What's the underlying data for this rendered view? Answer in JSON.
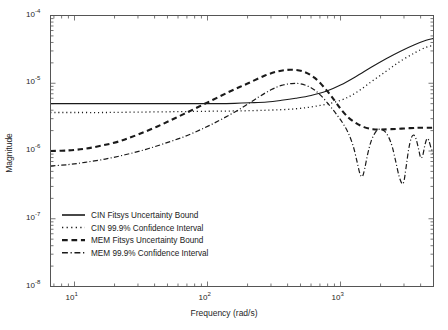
{
  "chart_data": {
    "type": "line",
    "title": "",
    "xlabel": "Frequency (rad/s)",
    "ylabel": "Magnitude",
    "xscale": "log",
    "yscale": "log",
    "xlim": [
      6.6,
      5000
    ],
    "ylim": [
      1e-08,
      0.0001
    ],
    "grid": false,
    "legend_position": "lower left",
    "xticks": [
      {
        "value": 10,
        "label": "10",
        "exp": "1"
      },
      {
        "value": 100,
        "label": "10",
        "exp": "2"
      },
      {
        "value": 1000,
        "label": "10",
        "exp": "3"
      }
    ],
    "yticks": [
      {
        "value": 0.0001,
        "label": "10",
        "exp": "-4"
      },
      {
        "value": 1e-05,
        "label": "10",
        "exp": "-5"
      },
      {
        "value": 1e-06,
        "label": "10",
        "exp": "-6"
      },
      {
        "value": 1e-07,
        "label": "10",
        "exp": "-7"
      },
      {
        "value": 1e-08,
        "label": "10",
        "exp": "-8"
      }
    ],
    "series": [
      {
        "name": "CIN Fitsys Uncertainty Bound",
        "style": "solid",
        "color": "#1a1a1a",
        "width": 1.1,
        "x": [
          6.6,
          8,
          10,
          13,
          17,
          22,
          30,
          40,
          55,
          70,
          90,
          120,
          160,
          210,
          280,
          360,
          460,
          600,
          780,
          1000,
          1300,
          1700,
          2200,
          2800,
          3600,
          4400,
          5000
        ],
        "y": [
          5e-06,
          5e-06,
          5e-06,
          5e-06,
          5e-06,
          5e-06,
          5e-06,
          5e-06,
          5e-06,
          5e-06,
          5e-06,
          5e-06,
          5.05e-06,
          5.15e-06,
          5.3e-06,
          5.6e-06,
          6e-06,
          6.6e-06,
          7.6e-06,
          9.4e-06,
          1.25e-05,
          1.72e-05,
          2.3e-05,
          2.95e-05,
          3.7e-05,
          4.3e-05,
          4.6e-05
        ]
      },
      {
        "name": "CIN 99.9% Confidence Interval",
        "style": "dotted",
        "color": "#1a1a1a",
        "width": 1.3,
        "x": [
          6.6,
          10,
          17,
          30,
          55,
          90,
          160,
          280,
          460,
          700,
          1000,
          1300,
          1700,
          2200,
          2800,
          3600,
          4400,
          5000
        ],
        "y": [
          3.7e-06,
          3.7e-06,
          3.7e-06,
          3.75e-06,
          3.8e-06,
          3.85e-06,
          3.9e-06,
          4e-06,
          4.2e-06,
          4.7e-06,
          5.6e-06,
          7.2e-06,
          1.05e-05,
          1.5e-05,
          2.1e-05,
          2.8e-05,
          3.4e-05,
          3.6e-05
        ]
      },
      {
        "name": "MEM Fitsys Uncertainty Bound",
        "style": "dashed",
        "color": "#1a1a1a",
        "width": 2.1,
        "x": [
          6.6,
          9,
          12,
          16,
          22,
          30,
          42,
          58,
          80,
          110,
          150,
          200,
          270,
          340,
          420,
          520,
          640,
          780,
          900,
          1020,
          1150,
          1300,
          1500,
          1750,
          2000,
          2400,
          3000,
          3800,
          4600,
          5000
        ],
        "y": [
          1e-06,
          1.02e-06,
          1.08e-06,
          1.2e-06,
          1.4e-06,
          1.75e-06,
          2.3e-06,
          3.1e-06,
          4.2e-06,
          5.7e-06,
          7.7e-06,
          9.9e-06,
          1.3e-05,
          1.5e-05,
          1.58e-05,
          1.5e-05,
          1.2e-05,
          8e-06,
          5.6e-06,
          4e-06,
          3.1e-06,
          2.6e-06,
          2.25e-06,
          2.1e-06,
          2.08e-06,
          2.1e-06,
          2.15e-06,
          2.2e-06,
          2.2e-06,
          2.2e-06
        ]
      },
      {
        "name": "MEM 99.9% Confidence Interval",
        "style": "dashdot",
        "color": "#1a1a1a",
        "width": 1.2,
        "x": [
          6.6,
          9,
          12,
          17,
          24,
          34,
          48,
          68,
          95,
          130,
          180,
          240,
          300,
          360,
          430,
          500,
          600,
          700,
          820,
          940,
          1050,
          1150,
          1250,
          1330,
          1400,
          1460,
          1520,
          1600,
          1700,
          1850,
          2000,
          2150,
          2300,
          2450,
          2600,
          2750,
          2900,
          3000,
          3100,
          3250,
          3400,
          3550,
          3700,
          3850,
          4000,
          4150,
          4300,
          4450,
          4600,
          4800,
          5000
        ],
        "y": [
          6e-07,
          6.3e-07,
          6.8e-07,
          7.6e-07,
          8.8e-07,
          1.05e-06,
          1.3e-06,
          1.65e-06,
          2.2e-06,
          3e-06,
          4.3e-06,
          6.2e-06,
          8e-06,
          9.3e-06,
          9.9e-06,
          9.8e-06,
          8.6e-06,
          6.8e-06,
          4.8e-06,
          3.4e-06,
          2.5e-06,
          1.8e-06,
          1.15e-06,
          7e-07,
          4.6e-07,
          4.2e-07,
          5.5e-07,
          9e-07,
          1.4e-06,
          1.95e-06,
          2.1e-06,
          1.95e-06,
          1.6e-06,
          1.15e-06,
          7e-07,
          4.3e-07,
          3.3e-07,
          3.6e-07,
          5.5e-07,
          1.05e-06,
          1.55e-06,
          1.72e-06,
          1.5e-06,
          1.1e-06,
          8e-07,
          8.6e-07,
          1.2e-06,
          1.5e-06,
          1.45e-06,
          1.1e-06,
          9e-07
        ]
      }
    ],
    "legend": [
      {
        "label": "CIN Fitsys Uncertainty Bound",
        "style": "solid",
        "width": 1.6
      },
      {
        "label": "CIN 99.9% Confidence Interval",
        "style": "dotted",
        "width": 1.5
      },
      {
        "label": "MEM Fitsys Uncertainty Bound",
        "style": "dashed",
        "width": 2.2
      },
      {
        "label": "MEM 99.9% Confidence Interval",
        "style": "dashdot",
        "width": 1.4
      }
    ]
  }
}
